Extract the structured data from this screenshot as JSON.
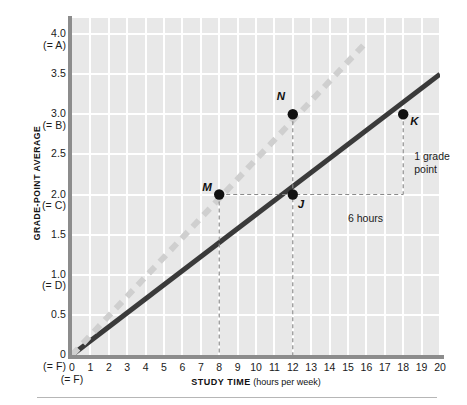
{
  "chart_data": {
    "type": "line",
    "title": "",
    "xlabel": "STUDY TIME (hours per week)",
    "xlabel_bold": "STUDY TIME",
    "xlabel_paren": "(hours per week)",
    "ylabel": "GRADE-POINT AVERAGE",
    "xlim": [
      0,
      20
    ],
    "ylim": [
      0,
      4.2
    ],
    "grid": true,
    "legend": "none",
    "x_ticks": [
      0,
      1,
      2,
      3,
      4,
      5,
      6,
      7,
      8,
      9,
      10,
      11,
      12,
      13,
      14,
      15,
      16,
      17,
      18,
      19,
      20
    ],
    "x_tick_labels": [
      "0",
      "1",
      "2",
      "3",
      "4",
      "5",
      "6",
      "7",
      "8",
      "9",
      "10",
      "11",
      "12",
      "13",
      "14",
      "15",
      "16",
      "17",
      "18",
      "19",
      "20"
    ],
    "x_zero_sublabel": "(= F)",
    "y_ticks": [
      0,
      0.5,
      1.0,
      1.5,
      2.0,
      2.5,
      3.0,
      3.5,
      4.0
    ],
    "y_tick_labels": [
      {
        "value": 0,
        "label": "0",
        "sub": "(= F)"
      },
      {
        "value": 0.5,
        "label": "0.5",
        "sub": ""
      },
      {
        "value": 1.0,
        "label": "1.0",
        "sub": "(= D)"
      },
      {
        "value": 1.5,
        "label": "1.5",
        "sub": ""
      },
      {
        "value": 2.0,
        "label": "2.0",
        "sub": "(= C)"
      },
      {
        "value": 2.5,
        "label": "2.5",
        "sub": ""
      },
      {
        "value": 3.0,
        "label": "3.0",
        "sub": "(= B)"
      },
      {
        "value": 3.5,
        "label": "3.5",
        "sub": ""
      },
      {
        "value": 4.0,
        "label": "4.0",
        "sub": "(= A)"
      }
    ],
    "series": [
      {
        "name": "solid-line",
        "style": "solid",
        "color": "#3a3a3a",
        "x": [
          0,
          20
        ],
        "values": [
          0,
          3.5
        ],
        "slope": 0.175
      },
      {
        "name": "dashed-line",
        "style": "dashed",
        "color": "#cfcfcf",
        "x": [
          0,
          16
        ],
        "values": [
          0,
          3.9
        ],
        "slope": 0.24
      }
    ],
    "points": [
      {
        "name": "M",
        "x": 8,
        "y": 2.0,
        "label_pos": "left"
      },
      {
        "name": "N",
        "x": 12,
        "y": 3.0,
        "label_pos": "upper-left"
      },
      {
        "name": "J",
        "x": 12,
        "y": 2.0,
        "label_pos": "lower-right"
      },
      {
        "name": "K",
        "x": 18,
        "y": 3.0,
        "label_pos": "lower-right"
      }
    ],
    "annotations": [
      {
        "name": "rise-label",
        "text_line1": "1 grade",
        "text_line2": "point",
        "x": 18.6,
        "y": 2.55
      },
      {
        "name": "run-label",
        "text_line1": "6 hours",
        "text_line2": "",
        "x": 15.0,
        "y": 1.78
      }
    ],
    "colors": {
      "plot_background": "#e8e8e8",
      "gridline": "#ffffff",
      "axis": "#8c8c8c",
      "solid_series": "#3a3a3a",
      "dashed_series": "#cfcfcf",
      "point_marker": "#111111",
      "leader_line": "#8a8a8a",
      "text": "#1a1a1a"
    }
  }
}
